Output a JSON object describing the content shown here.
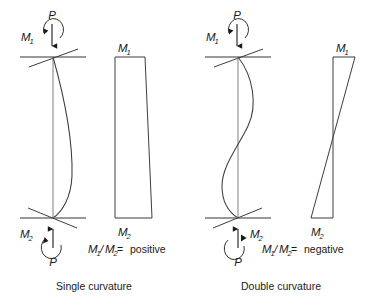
{
  "figure": {
    "background_color": "#ffffff",
    "line_color": "#3d3d3d",
    "support_color": "#777777"
  },
  "panels": [
    {
      "id": "single-curvature",
      "caption": "Single curvature",
      "ratio_expression": {
        "numerator_symbol": "M",
        "numerator_sub": "1",
        "slash": "/",
        "denominator_symbol": "M",
        "denominator_sub": "2",
        "equals": " = ",
        "result": "positive"
      },
      "column": {
        "top_moment": {
          "symbol": "M",
          "sub": "1",
          "side": "left"
        },
        "bottom_moment": {
          "symbol": "M",
          "sub": "2",
          "side": "left"
        },
        "top_load": {
          "symbol": "P",
          "direction": "down"
        },
        "bottom_load": {
          "symbol": "P",
          "direction": "up"
        },
        "deflection": "single-bow-right"
      },
      "moment_diagram": {
        "top_label": {
          "symbol": "M",
          "sub": "1"
        },
        "bottom_label": {
          "symbol": "M",
          "sub": "2"
        },
        "shape": "trapezoid-one-side",
        "top_width": 30,
        "bottom_width": 42,
        "sign": "same-side"
      }
    },
    {
      "id": "double-curvature",
      "caption": "Double curvature",
      "ratio_expression": {
        "numerator_symbol": "M",
        "numerator_sub": "1",
        "slash": "/",
        "denominator_symbol": "M",
        "denominator_sub": "2",
        "equals": " = ",
        "result": "negative"
      },
      "column": {
        "top_moment": {
          "symbol": "M",
          "sub": "1",
          "side": "left"
        },
        "bottom_moment": {
          "symbol": "M",
          "sub": "2",
          "side": "right"
        },
        "top_load": {
          "symbol": "P",
          "direction": "down"
        },
        "bottom_load": {
          "symbol": "P",
          "direction": "up"
        },
        "deflection": "s-curve"
      },
      "moment_diagram": {
        "top_label": {
          "symbol": "M",
          "sub": "1"
        },
        "bottom_label": {
          "symbol": "M",
          "sub": "2"
        },
        "shape": "crossing-triangles",
        "top_width": 22,
        "bottom_width": 34,
        "sign": "opposite-side"
      }
    }
  ],
  "icons": {
    "axial_load_arrow": "arrow-icon",
    "moment_arc": "curved-moment-arrow-icon",
    "pin_support": "pin-support-icon"
  }
}
